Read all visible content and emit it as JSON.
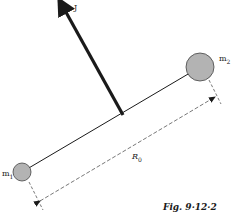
{
  "diagram": {
    "vector_label": "J",
    "mass1_label": "m",
    "mass1_sub": "1",
    "mass2_label": "m",
    "mass2_sub": "2",
    "distance_label": "R",
    "distance_sub": "0",
    "caption": "Fig. 9·12·2",
    "colors": {
      "ink": "#1a1a1a",
      "mass_fill": "#b3b3b3",
      "dashed": "#555555"
    }
  }
}
